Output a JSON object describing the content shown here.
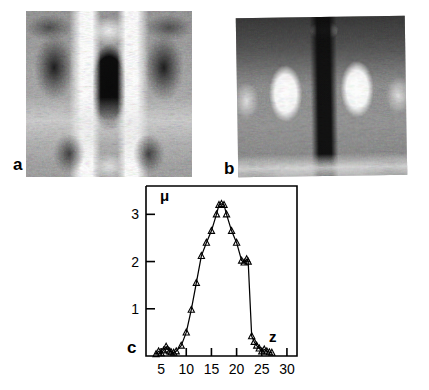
{
  "figure": {
    "panels": [
      {
        "id": "a",
        "label": "a",
        "type": "stm-grayscale-image",
        "description": "grayscale scanning-tunneling-microscope image with dark central rectangle flanked by bright vertical bands"
      },
      {
        "id": "b",
        "label": "b",
        "type": "stm-grayscale-image",
        "description": "grayscale scanning-tunneling-microscope image with dark central vertical stripe between two bright lobes"
      },
      {
        "id": "c",
        "label": "c",
        "type": "line-plot"
      }
    ]
  },
  "chart_data": {
    "type": "line",
    "title": "",
    "xlabel": "z",
    "ylabel": "μ",
    "xlim": [
      2,
      32
    ],
    "ylim": [
      0,
      3.6
    ],
    "xticks": [
      5,
      10,
      15,
      20,
      25,
      30
    ],
    "xtick_labels": [
      "5",
      "10",
      "15",
      "20",
      "25",
      "30"
    ],
    "yticks": [
      1,
      2,
      3
    ],
    "ytick_labels": [
      "1",
      "2",
      "3"
    ],
    "grid": false,
    "legend": null,
    "marker": "triangle-up",
    "series": [
      {
        "name": "μ(z)",
        "x": [
          4.0,
          4.5,
          5.0,
          5.5,
          6.0,
          6.3,
          6.7,
          7.0,
          7.5,
          8.0,
          9.0,
          10.0,
          11.0,
          12.0,
          13.0,
          14.0,
          15.0,
          16.0,
          16.5,
          17.0,
          17.5,
          18.0,
          19.0,
          20.0,
          21.0,
          21.5,
          22.0,
          22.3,
          23.0,
          23.5,
          24.0,
          24.5,
          25.0,
          25.5,
          26.0,
          26.5,
          27.0
        ],
        "y": [
          0.04,
          0.1,
          0.06,
          0.12,
          0.2,
          0.14,
          0.1,
          0.08,
          0.07,
          0.1,
          0.22,
          0.5,
          0.98,
          1.55,
          2.12,
          2.4,
          2.65,
          3.0,
          3.2,
          3.22,
          3.2,
          3.0,
          2.65,
          2.4,
          2.02,
          1.98,
          2.05,
          2.0,
          0.42,
          0.3,
          0.22,
          0.16,
          0.1,
          0.14,
          0.1,
          0.08,
          0.07
        ]
      }
    ]
  }
}
